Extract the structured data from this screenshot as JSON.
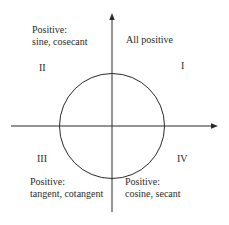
{
  "diagram": {
    "colors": {
      "line": "#2a2a2a",
      "text": "#2a2a2a",
      "background": "#ffffff"
    },
    "quadrants": [
      {
        "numeral": "I",
        "note_lines": [
          "All positive"
        ]
      },
      {
        "numeral": "II",
        "note_lines": [
          "Positive:",
          "sine, cosecant"
        ]
      },
      {
        "numeral": "III",
        "note_lines": [
          "Positive:",
          "tangent, cotangent"
        ]
      },
      {
        "numeral": "IV",
        "note_lines": [
          "Positive:",
          "cosine, secant"
        ]
      }
    ],
    "icons": {
      "x_axis": "arrow-right",
      "y_axis": "arrow-up",
      "unit_circle": "circle"
    }
  }
}
